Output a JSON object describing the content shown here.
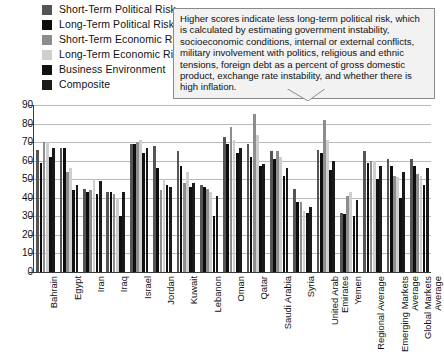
{
  "callout": {
    "text": "Higher scores indicate less long-term political risk, which is calculated by estimating government instability, socioeconomic conditions, internal or external conflicts, military involvement with politics, religious and ethnic tensions, foreign debt as a percent of gross domestic product, exchange rate instability, and whether there is high inflation."
  },
  "legend": {
    "items": [
      {
        "label": "Short-Term Political Risk",
        "color": "#555555"
      },
      {
        "label": "Long-Term Political Risk",
        "color": "#0d0d0d"
      },
      {
        "label": "Short-Term Economic Risk",
        "color": "#8d8d8d"
      },
      {
        "label": "Long-Term Economic Risk",
        "color": "#cfcfcf"
      },
      {
        "label": "Business Environment",
        "color": "#111111"
      },
      {
        "label": "Composite",
        "color": "#1a1a1a"
      }
    ]
  },
  "chart_data": {
    "type": "bar",
    "title": "",
    "xlabel": "",
    "ylabel": "",
    "ylim": [
      0,
      90
    ],
    "ytick_step": 10,
    "yticks": [
      0,
      10,
      20,
      30,
      40,
      50,
      60,
      70,
      80,
      90
    ],
    "grid": true,
    "legend_position": "top-left",
    "categories": [
      "Bahrain",
      "Egypt",
      "Iran",
      "Iraq",
      "Israel",
      "Jordan",
      "Kuwait",
      "Lebanon",
      "Oman",
      "Qatar",
      "Saudi Arabia",
      "Syria",
      "United Arab\nEmirates",
      "Yemen",
      "Regional Average",
      "Emerging Markets\nAverage",
      "Global Markets\nAverage"
    ],
    "series": [
      {
        "name": "Short-Term Political Risk",
        "color": "#555555",
        "values": [
          66,
          67,
          45,
          43,
          69,
          68,
          65,
          47,
          73,
          69,
          65,
          45,
          66,
          32,
          65,
          61,
          61
        ]
      },
      {
        "name": "Long-Term Political Risk",
        "color": "#0d0d0d",
        "values": [
          59,
          67,
          43,
          43,
          69,
          56,
          57,
          46,
          69,
          62,
          61,
          38,
          64,
          31,
          59,
          57,
          57
        ]
      },
      {
        "name": "Short-Term Economic Risk",
        "color": "#8d8d8d",
        "values": [
          70,
          54,
          44,
          42,
          70,
          44,
          48,
          45,
          78,
          85,
          65,
          38,
          82,
          41,
          60,
          52,
          53
        ]
      },
      {
        "name": "Long-Term Economic Risk",
        "color": "#cfcfcf",
        "values": [
          70,
          56,
          50,
          40,
          71,
          50,
          54,
          43,
          71,
          74,
          62,
          33,
          71,
          43,
          60,
          51,
          52
        ]
      },
      {
        "name": "Business Environment",
        "color": "#111111",
        "values": [
          62,
          44,
          42,
          30,
          64,
          47,
          46,
          30,
          64,
          57,
          52,
          32,
          55,
          30,
          50,
          40,
          47
        ]
      },
      {
        "name": "Composite",
        "color": "#1a1a1a",
        "values": [
          67,
          47,
          49,
          43,
          67,
          46,
          48,
          41,
          67,
          58,
          56,
          35,
          60,
          39,
          57,
          54,
          56
        ]
      }
    ]
  }
}
